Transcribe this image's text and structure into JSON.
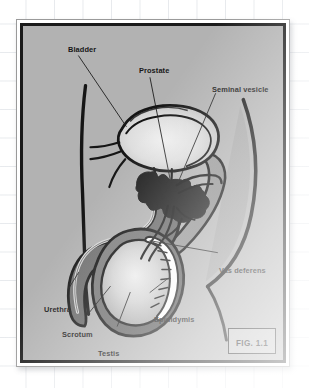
{
  "figure": {
    "caption": "FIG. 1.1",
    "panel_color": "#b2b2b2",
    "border_color": "#1a1a1a",
    "page_color": "#ffffff",
    "grid_color": "#96a0af",
    "ink_color": "#171717"
  },
  "labels": [
    {
      "id": "bladder",
      "text": "Bladder",
      "x": 61,
      "y": 42
    },
    {
      "id": "prostate",
      "text": "Prostate",
      "x": 132,
      "y": 63
    },
    {
      "id": "seminal-vesicle",
      "text": "Seminal vesicle",
      "x": 207,
      "y": 82
    },
    {
      "id": "vas-deferens",
      "text": "Vas deferens",
      "x": 236,
      "y": 262
    },
    {
      "id": "epididymis",
      "text": "Epididymis",
      "x": 148,
      "y": 311
    },
    {
      "id": "urethra",
      "text": "Urethra",
      "x": 38,
      "y": 301
    },
    {
      "id": "scrotum",
      "text": "Scrotum",
      "x": 56,
      "y": 326
    },
    {
      "id": "testis",
      "text": "Testis",
      "x": 92,
      "y": 345
    }
  ],
  "structures": [
    {
      "id": "bladder",
      "name": "Bladder",
      "fill": "#d9d9d9"
    },
    {
      "id": "prostate",
      "name": "Prostate",
      "fill": "#1e1e1e"
    },
    {
      "id": "seminal-vesicle",
      "name": "Seminal vesicle",
      "fill": "#1e1e1e"
    },
    {
      "id": "vas-deferens",
      "name": "Vas deferens",
      "fill": "#b2b2b2"
    },
    {
      "id": "epididymis",
      "name": "Epididymis",
      "fill": "#fbfbfb"
    },
    {
      "id": "testis",
      "name": "Testis",
      "fill": "#d5d5d5"
    },
    {
      "id": "scrotum",
      "name": "Scrotum",
      "fill": "#6f6f6f"
    },
    {
      "id": "penis-shaft",
      "name": "Penis",
      "fill": "#6f6f6f"
    },
    {
      "id": "urethra",
      "name": "Urethra",
      "fill": "#cfcfcf"
    },
    {
      "id": "rectum",
      "name": "Rectum",
      "fill": "#a0a0a0"
    },
    {
      "id": "body-outline",
      "name": "Body wall",
      "fill": "none"
    }
  ]
}
